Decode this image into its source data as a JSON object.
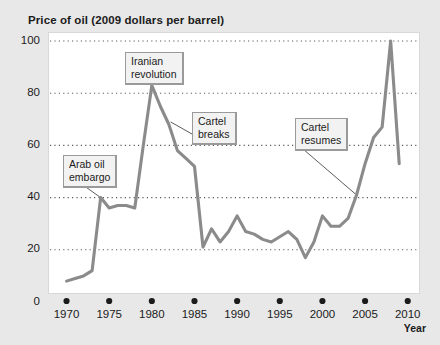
{
  "chart": {
    "title": "Price of oil (2009 dollars per barrel)",
    "xaxis_title": "Year"
  },
  "chart_data": {
    "type": "line",
    "title": "Price of oil (2009 dollars per barrel)",
    "xlabel": "Year",
    "ylabel": "Price of oil (2009 dollars per barrel)",
    "xlim": [
      1969,
      2010.5
    ],
    "ylim": [
      0,
      105
    ],
    "xticks": [
      1970,
      1975,
      1980,
      1985,
      1990,
      1995,
      2000,
      2005,
      2010
    ],
    "yticks": [
      0,
      20,
      40,
      60,
      80,
      100
    ],
    "xtick_labels": [
      "1970",
      "1975",
      "1980",
      "1985",
      "1990",
      "1995",
      "2000",
      "2005",
      "2010"
    ],
    "ytick_labels": [
      "0",
      "20",
      "40",
      "60",
      "80",
      "100"
    ],
    "grid": "horizontal-dotted",
    "legend": "none",
    "line_color": "#8b8b8b",
    "x": [
      1970,
      1971,
      1972,
      1973,
      1974,
      1975,
      1976,
      1977,
      1978,
      1979,
      1980,
      1981,
      1982,
      1983,
      1984,
      1985,
      1986,
      1987,
      1988,
      1989,
      1990,
      1991,
      1992,
      1993,
      1994,
      1995,
      1996,
      1997,
      1998,
      1999,
      2000,
      2001,
      2002,
      2003,
      2004,
      2005,
      2006,
      2007,
      2008,
      2009
    ],
    "values": [
      8,
      9,
      10,
      12,
      40,
      36,
      37,
      37,
      36,
      60,
      83,
      75,
      68,
      58,
      55,
      52,
      21,
      28,
      23,
      27,
      33,
      27,
      26,
      24,
      23,
      25,
      27,
      24,
      17,
      23,
      33,
      29,
      29,
      32,
      41,
      53,
      63,
      67,
      100,
      53
    ],
    "annotations": [
      {
        "id": "arab-oil-embargo",
        "label": "Arab oil embargo",
        "label_lines": [
          "Arab oil",
          "embargo"
        ],
        "points_to_year": 1974,
        "points_to_value": 40
      },
      {
        "id": "iranian-revolution",
        "label": "Iranian revolution",
        "label_lines": [
          "Iranian",
          "revolution"
        ],
        "points_to_year": 1980,
        "points_to_value": 83
      },
      {
        "id": "cartel-breaks",
        "label": "Cartel breaks",
        "label_lines": [
          "Cartel",
          "breaks"
        ],
        "points_to_year": 1982,
        "points_to_value": 68
      },
      {
        "id": "cartel-resumes",
        "label": "Cartel resumes",
        "label_lines": [
          "Cartel",
          "resumes"
        ],
        "points_to_year": 2004,
        "points_to_value": 41
      }
    ]
  }
}
